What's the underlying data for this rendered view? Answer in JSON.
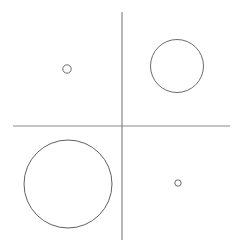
{
  "figure": {
    "title": "",
    "background_color": "#ffffff",
    "width": 243,
    "height": 250
  },
  "chart_data": {
    "type": "scatter",
    "title": "",
    "subtitle": "",
    "xlabel": "",
    "ylabel": "",
    "grid": false,
    "legend": "none",
    "axes": {
      "origin": {
        "x": 122,
        "y": 126
      },
      "x_axis": {
        "name": "horizontal-axis",
        "x_start": 13,
        "x_end": 230,
        "y": 126,
        "color": "#8a8a8a",
        "width": 1
      },
      "y_axis": {
        "name": "vertical-axis",
        "y_start": 12,
        "y_end": 240,
        "x": 122,
        "color": "#6f6f6f",
        "width": 1
      }
    },
    "markers": [
      {
        "name": "quadrant-2-circle",
        "quadrant": "top-left",
        "cx": 67,
        "cy": 69,
        "r": 4.2,
        "stroke": "#6b6b6b",
        "stroke_width": 1,
        "fill": "none",
        "size_rank": "small"
      },
      {
        "name": "quadrant-1-circle",
        "quadrant": "top-right",
        "cx": 177,
        "cy": 66,
        "r": 26.5,
        "stroke": "#6b6b6b",
        "stroke_width": 1,
        "fill": "none",
        "size_rank": "large"
      },
      {
        "name": "quadrant-3-circle",
        "quadrant": "bottom-left",
        "cx": 68,
        "cy": 184,
        "r": 44,
        "stroke": "#5f5f5f",
        "stroke_width": 1,
        "fill": "none",
        "size_rank": "largest"
      },
      {
        "name": "quadrant-4-circle",
        "quadrant": "bottom-right",
        "cx": 178,
        "cy": 183,
        "r": 3.2,
        "stroke": "#6b6b6b",
        "stroke_width": 1,
        "fill": "none",
        "size_rank": "smallest"
      }
    ]
  }
}
